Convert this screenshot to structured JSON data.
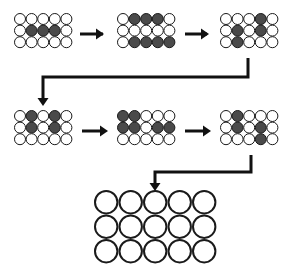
{
  "diagram": {
    "colors": {
      "filled": "#4a4a4a",
      "empty": "#ffffff",
      "stroke": "#1a1a1a",
      "background": "#ffffff"
    },
    "legend": {
      "1": "filled (dark) circle",
      "0": "empty (white) circle"
    },
    "grids": [
      {
        "id": "grid-1",
        "x": 14,
        "y": 13,
        "r": 6,
        "step": 11.6,
        "pattern": [
          [
            0,
            0,
            0,
            0,
            0
          ],
          [
            0,
            1,
            1,
            1,
            0
          ],
          [
            0,
            0,
            0,
            0,
            0
          ]
        ]
      },
      {
        "id": "grid-2",
        "x": 117,
        "y": 13,
        "r": 6,
        "step": 11.6,
        "pattern": [
          [
            0,
            1,
            1,
            1,
            0
          ],
          [
            0,
            0,
            0,
            0,
            0
          ],
          [
            0,
            1,
            1,
            1,
            1
          ]
        ]
      },
      {
        "id": "grid-3",
        "x": 220,
        "y": 13,
        "r": 6,
        "step": 11.6,
        "pattern": [
          [
            0,
            0,
            0,
            1,
            0
          ],
          [
            0,
            1,
            0,
            1,
            0
          ],
          [
            0,
            1,
            0,
            0,
            0
          ]
        ]
      },
      {
        "id": "grid-4",
        "x": 14,
        "y": 110,
        "r": 6,
        "step": 11.6,
        "pattern": [
          [
            0,
            1,
            0,
            1,
            0
          ],
          [
            0,
            1,
            0,
            1,
            0
          ],
          [
            0,
            0,
            0,
            0,
            0
          ]
        ]
      },
      {
        "id": "grid-5",
        "x": 117,
        "y": 110,
        "r": 6,
        "step": 11.6,
        "pattern": [
          [
            1,
            1,
            0,
            0,
            0
          ],
          [
            1,
            1,
            0,
            1,
            1
          ],
          [
            0,
            0,
            0,
            0,
            0
          ]
        ]
      },
      {
        "id": "grid-6",
        "x": 220,
        "y": 110,
        "r": 6,
        "step": 11.6,
        "pattern": [
          [
            0,
            1,
            0,
            0,
            0
          ],
          [
            0,
            1,
            0,
            1,
            0
          ],
          [
            0,
            0,
            0,
            1,
            0
          ]
        ]
      },
      {
        "id": "grid-final",
        "x": 94,
        "y": 190,
        "r": 12.2,
        "step": 24.5,
        "pattern": [
          [
            0,
            0,
            0,
            0,
            0
          ],
          [
            0,
            0,
            0,
            0,
            0
          ],
          [
            0,
            0,
            0,
            0,
            0
          ]
        ]
      }
    ],
    "arrows": [
      {
        "id": "arrow-1-to-2",
        "points": [
          [
            80,
            34
          ],
          [
            103,
            34
          ]
        ],
        "head": [
          104,
          34
        ]
      },
      {
        "id": "arrow-2-to-3",
        "points": [
          [
            185,
            34
          ],
          [
            207,
            34
          ]
        ],
        "head": [
          209,
          34
        ]
      },
      {
        "id": "connector-3-to-4",
        "points": [
          [
            248,
            58
          ],
          [
            248,
            77
          ],
          [
            43,
            77
          ],
          [
            43,
            99
          ]
        ],
        "head": [
          43,
          106
        ]
      },
      {
        "id": "arrow-4-to-5",
        "points": [
          [
            82,
            131
          ],
          [
            105,
            131
          ]
        ],
        "head": [
          108,
          131
        ]
      },
      {
        "id": "arrow-5-to-6",
        "points": [
          [
            185,
            131
          ],
          [
            207,
            131
          ]
        ],
        "head": [
          211,
          131
        ]
      },
      {
        "id": "connector-6-to-final",
        "points": [
          [
            251,
            155
          ],
          [
            251,
            172
          ],
          [
            155,
            172
          ],
          [
            155,
            184
          ]
        ],
        "head": [
          155,
          191
        ]
      }
    ]
  }
}
